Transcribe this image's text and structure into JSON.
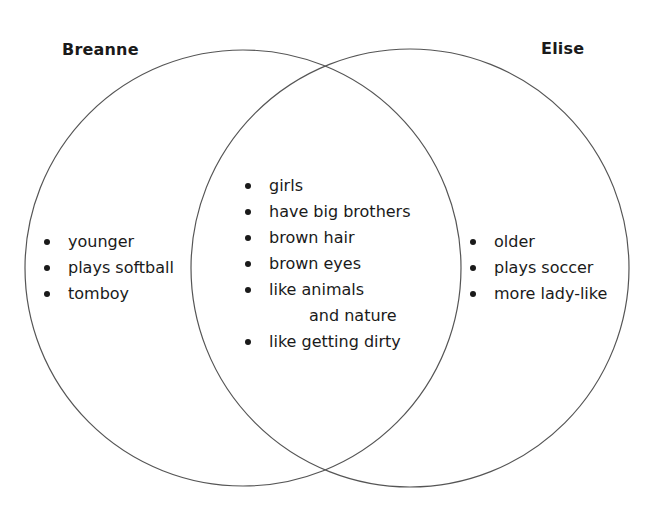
{
  "diagram": {
    "type": "venn",
    "line_color": "#555555",
    "text_color": "#1a1a1a",
    "left": {
      "title": "Breanne",
      "items": [
        "younger",
        "plays softball",
        "tomboy"
      ]
    },
    "right": {
      "title": "Elise",
      "items": [
        "older",
        "plays soccer",
        "more lady-like"
      ]
    },
    "overlap": {
      "items": [
        "girls",
        "have big brothers",
        "brown hair",
        "brown eyes",
        "like animals",
        "and nature",
        "like getting dirty"
      ]
    }
  }
}
